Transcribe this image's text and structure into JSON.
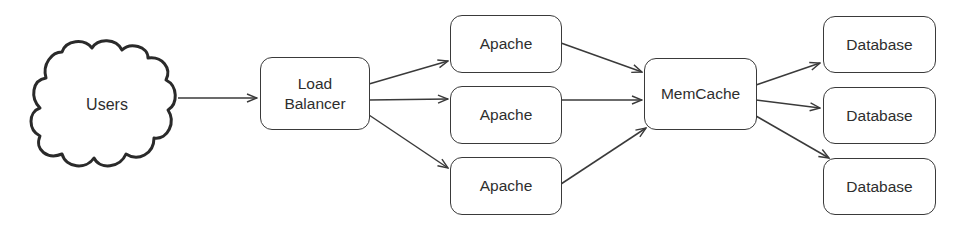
{
  "diagram": {
    "type": "architecture-flow",
    "colors": {
      "stroke": "#3a3a3a",
      "text": "#2e2e2e",
      "background": "#ffffff"
    },
    "nodes": {
      "users": {
        "label": "Users",
        "shape": "cloud"
      },
      "load_balancer": {
        "label_line1": "Load",
        "label_line2": "Balancer",
        "shape": "rounded-rect"
      },
      "apache": [
        {
          "label": "Apache"
        },
        {
          "label": "Apache"
        },
        {
          "label": "Apache"
        }
      ],
      "memcache": {
        "label": "MemCache",
        "shape": "rounded-rect"
      },
      "database": [
        {
          "label": "Database"
        },
        {
          "label": "Database"
        },
        {
          "label": "Database"
        }
      ]
    },
    "edges": [
      {
        "from": "Users",
        "to": "Load Balancer"
      },
      {
        "from": "Load Balancer",
        "to": "Apache 1"
      },
      {
        "from": "Load Balancer",
        "to": "Apache 2"
      },
      {
        "from": "Load Balancer",
        "to": "Apache 3"
      },
      {
        "from": "Apache 1",
        "to": "MemCache"
      },
      {
        "from": "Apache 2",
        "to": "MemCache"
      },
      {
        "from": "Apache 3",
        "to": "MemCache"
      },
      {
        "from": "MemCache",
        "to": "Database 1"
      },
      {
        "from": "MemCache",
        "to": "Database 2"
      },
      {
        "from": "MemCache",
        "to": "Database 3"
      }
    ]
  }
}
